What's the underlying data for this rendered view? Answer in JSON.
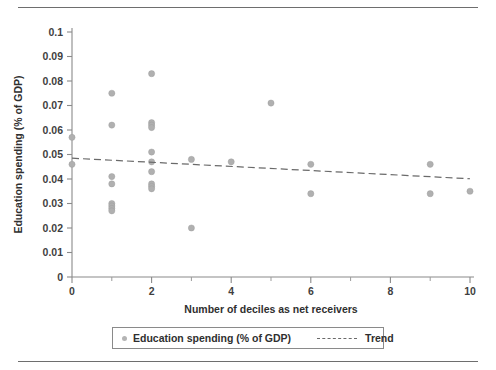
{
  "chart_data": {
    "type": "scatter",
    "title": "",
    "xlabel": "Number of deciles as net receivers",
    "ylabel": "Education spending (% of GDP)",
    "xlim": [
      0,
      10
    ],
    "ylim": [
      0,
      0.1
    ],
    "grid": false,
    "legend_position": "bottom",
    "x_ticks": [
      0,
      2,
      4,
      6,
      8,
      10
    ],
    "x_tick_labels": [
      "0",
      "2",
      "4",
      "6",
      "8",
      "10"
    ],
    "x_minor_ticks": [
      1,
      3,
      5,
      7,
      9
    ],
    "y_ticks": [
      0,
      0.01,
      0.02,
      0.03,
      0.04,
      0.05,
      0.06,
      0.07,
      0.08,
      0.09,
      0.1
    ],
    "y_tick_labels": [
      "0",
      "0.01",
      "0.02",
      "0.03",
      "0.04",
      "0.05",
      "0.06",
      "0.07",
      "0.08",
      "0.09",
      "0.1"
    ],
    "series": [
      {
        "name": "Education spending (% of GDP)",
        "type": "scatter",
        "color": "#b0b0b0",
        "marker": "circle",
        "points": [
          {
            "x": 0,
            "y": 0.057
          },
          {
            "x": 0,
            "y": 0.046
          },
          {
            "x": 1,
            "y": 0.075
          },
          {
            "x": 1,
            "y": 0.062
          },
          {
            "x": 1,
            "y": 0.041
          },
          {
            "x": 1,
            "y": 0.038
          },
          {
            "x": 1,
            "y": 0.03
          },
          {
            "x": 1,
            "y": 0.029
          },
          {
            "x": 1,
            "y": 0.028
          },
          {
            "x": 1,
            "y": 0.027
          },
          {
            "x": 2,
            "y": 0.083
          },
          {
            "x": 2,
            "y": 0.063
          },
          {
            "x": 2,
            "y": 0.062
          },
          {
            "x": 2,
            "y": 0.061
          },
          {
            "x": 2,
            "y": 0.051
          },
          {
            "x": 2,
            "y": 0.047
          },
          {
            "x": 2,
            "y": 0.043
          },
          {
            "x": 2,
            "y": 0.038
          },
          {
            "x": 2,
            "y": 0.037
          },
          {
            "x": 2,
            "y": 0.036
          },
          {
            "x": 3,
            "y": 0.048
          },
          {
            "x": 3,
            "y": 0.02
          },
          {
            "x": 4,
            "y": 0.047
          },
          {
            "x": 5,
            "y": 0.071
          },
          {
            "x": 6,
            "y": 0.046
          },
          {
            "x": 6,
            "y": 0.034
          },
          {
            "x": 9,
            "y": 0.046
          },
          {
            "x": 9,
            "y": 0.034
          },
          {
            "x": 10,
            "y": 0.035
          }
        ]
      },
      {
        "name": "Trend",
        "type": "line",
        "style": "dashed",
        "color": "#6a6a6a",
        "endpoints": [
          {
            "x": 0,
            "y": 0.0485
          },
          {
            "x": 10,
            "y": 0.0401
          }
        ]
      }
    ],
    "legend_entries": [
      {
        "label": "Education spending (% of GDP)",
        "marker": "circle",
        "color": "#b0b0b0"
      },
      {
        "label": "Trend",
        "marker": "dashed-line",
        "color": "#6a6a6a"
      }
    ]
  }
}
